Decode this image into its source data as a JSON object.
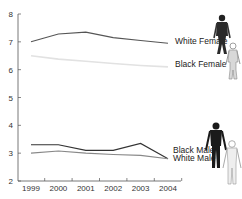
{
  "chart_data": {
    "type": "line",
    "title": "",
    "xlabel": "",
    "ylabel": "",
    "x": [
      "1999",
      "2000",
      "2001",
      "2002",
      "2003",
      "2004"
    ],
    "ylim": [
      2,
      8
    ],
    "yticks": [
      "2",
      "3",
      "4",
      "5",
      "6",
      "7",
      "8"
    ],
    "grid": false,
    "legend_position": "inline-right",
    "series": [
      {
        "name": "White Female",
        "color": "#555555",
        "values": [
          7.0,
          7.28,
          7.35,
          7.15,
          7.05,
          6.95
        ]
      },
      {
        "name": "Black Female",
        "color": "#e2e2e2",
        "values": [
          6.5,
          6.38,
          6.3,
          6.22,
          6.15,
          6.1
        ]
      },
      {
        "name": "Black Male",
        "color": "#333333",
        "values": [
          3.3,
          3.3,
          3.1,
          3.1,
          3.35,
          2.8
        ]
      },
      {
        "name": "White Male",
        "color": "#888888",
        "values": [
          3.0,
          3.08,
          3.0,
          2.95,
          2.92,
          2.8
        ]
      }
    ]
  },
  "icons": {
    "white_female": "dark-female-skeleton-figure",
    "black_female": "light-female-skeleton-figure",
    "black_male": "dark-male-skeleton-figure",
    "white_male": "light-male-skeleton-figure"
  }
}
